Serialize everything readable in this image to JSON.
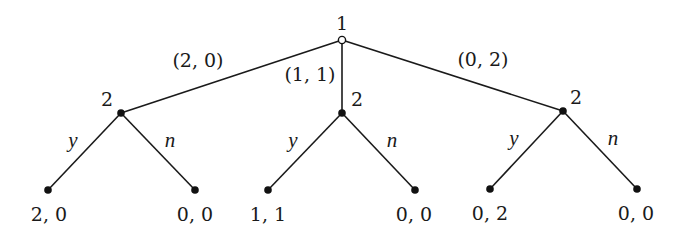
{
  "diagram": {
    "type": "extensive-form game tree",
    "root": {
      "player": "1",
      "marker": "hollow",
      "actions": [
        "(2,0)",
        "(1,1)",
        "(0,2)"
      ]
    },
    "second_movers": [
      {
        "player": "2",
        "offer": "(2,0)",
        "actions": [
          "y",
          "n"
        ],
        "payoffs": [
          "2, 0",
          "0, 0"
        ]
      },
      {
        "player": "2",
        "offer": "(1,1)",
        "actions": [
          "y",
          "n"
        ],
        "payoffs": [
          "1, 1",
          "0, 0"
        ]
      },
      {
        "player": "2",
        "offer": "(0,2)",
        "actions": [
          "y",
          "n"
        ],
        "payoffs": [
          "0, 2",
          "0, 0"
        ]
      }
    ]
  },
  "labels": {
    "root_player": "1",
    "edge_left": "(2, 0)",
    "edge_middle": "(1, 1)",
    "edge_right": "(0, 2)",
    "p2_left": "2",
    "p2_middle": "2",
    "p2_right": "2",
    "act_left_y": "y",
    "act_left_n": "n",
    "act_middle_y": "y",
    "act_middle_n": "n",
    "act_right_y": "y",
    "act_right_n": "n",
    "payoff_1": "2, 0",
    "payoff_2": "0, 0",
    "payoff_3": "1, 1",
    "payoff_4": "0, 0",
    "payoff_5": "0, 2",
    "payoff_6": "0, 0"
  },
  "colors": {
    "line": "#1a1a1a",
    "node": "#111111",
    "background": "#ffffff"
  }
}
